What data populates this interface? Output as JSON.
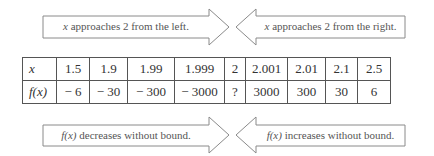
{
  "top_arrows": {
    "left": {
      "var": "x",
      "text": " approaches 2 from the left."
    },
    "right": {
      "var": "x",
      "text": " approaches 2 from the right."
    }
  },
  "table": {
    "row_x": {
      "label": "x",
      "values": [
        "1.5",
        "1.9",
        "1.99",
        "1.999",
        "2",
        "2.001",
        "2.01",
        "2.1",
        "2.5"
      ]
    },
    "row_fx": {
      "label": "f(x)",
      "values": [
        "− 6",
        "− 30",
        "− 300",
        "− 3000",
        "?",
        "3000",
        "300",
        "30",
        "6"
      ]
    }
  },
  "bottom_arrows": {
    "left": {
      "var": "f(x)",
      "text": " decreases without bound."
    },
    "right": {
      "var": "f(x)",
      "text": " increases without bound."
    }
  },
  "colors": {
    "stroke": "#8a8a8a",
    "text": "#555555",
    "table_border": "#555555"
  }
}
